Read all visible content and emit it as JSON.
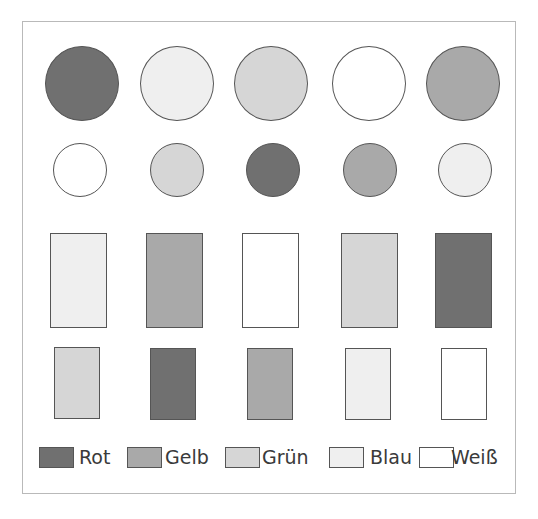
{
  "colors": {
    "Rot": "#707070",
    "Gelb": "#a9a9a9",
    "Grün": "#d6d6d6",
    "Blau": "#efefef",
    "Weiß": "#ffffff"
  },
  "rows": [
    {
      "name": "large-circles",
      "shape": "circle",
      "items": [
        "Rot",
        "Blau",
        "Grün",
        "Weiß",
        "Gelb"
      ]
    },
    {
      "name": "small-circles",
      "shape": "circle",
      "items": [
        "Weiß",
        "Grün",
        "Rot",
        "Gelb",
        "Blau"
      ]
    },
    {
      "name": "large-rectangles",
      "shape": "rect",
      "items": [
        "Blau",
        "Gelb",
        "Weiß",
        "Grün",
        "Rot"
      ]
    },
    {
      "name": "small-rectangles",
      "shape": "rect",
      "items": [
        "Grün",
        "Rot",
        "Gelb",
        "Blau",
        "Weiß"
      ]
    }
  ],
  "legend": [
    {
      "label": "Rot"
    },
    {
      "label": "Gelb"
    },
    {
      "label": "Grün"
    },
    {
      "label": "Blau"
    },
    {
      "label": "Weiß"
    }
  ]
}
